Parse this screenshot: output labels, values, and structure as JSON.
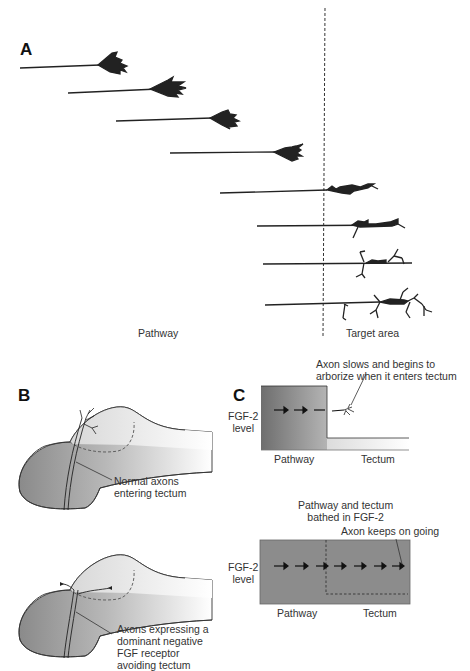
{
  "panel_a": {
    "letter": "A",
    "region_labels": {
      "left": "Pathway",
      "right": "Target area"
    },
    "growth_cone_count": 8,
    "boundary": "dashed vertical line"
  },
  "panel_b": {
    "letter": "B",
    "top_caption": [
      "Normal axons",
      "entering tectum"
    ],
    "bottom_caption": [
      "Axons expressing a",
      "dominant negative",
      "FGF receptor",
      "avoiding tectum"
    ]
  },
  "panel_c": {
    "letter": "C",
    "top": {
      "annotation": [
        "Axon slows and begins to",
        "arborize when it enters tectum"
      ],
      "y_label": [
        "FGF-2",
        "level"
      ],
      "x_labels": {
        "left": "Pathway",
        "right": "Tectum"
      }
    },
    "bottom": {
      "title": [
        "Pathway and tectum",
        "bathed in FGF-2"
      ],
      "annotation": "Axon keeps on going",
      "y_label": [
        "FGF-2",
        "level"
      ],
      "x_labels": {
        "left": "Pathway",
        "right": "Tectum"
      }
    }
  },
  "colors": {
    "ink": "#222222",
    "dark_gray": "#6e6e6e",
    "mid_gray": "#8a8a8a",
    "light_gray": "#e6e6e6"
  }
}
